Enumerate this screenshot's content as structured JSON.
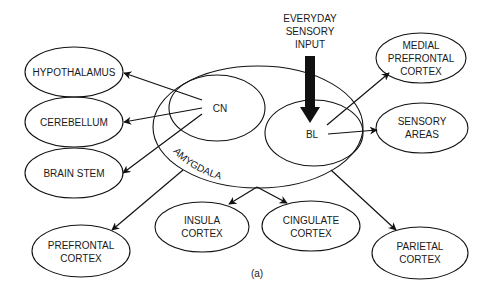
{
  "figure": {
    "caption": "(a)",
    "input_label": [
      "EVERYDAY",
      "SENSORY",
      "INPUT"
    ],
    "amygdala": {
      "label": "AMYGDALA",
      "nuclei": {
        "cn": "CN",
        "bl": "BL"
      }
    },
    "nodes": {
      "hypothalamus": [
        "HYPOTHALAMUS"
      ],
      "cerebellum": [
        "CEREBELLUM"
      ],
      "brain_stem": [
        "BRAIN STEM"
      ],
      "prefrontal_cortex": [
        "PREFRONTAL",
        "CORTEX"
      ],
      "insula_cortex": [
        "INSULA",
        "CORTEX"
      ],
      "cingulate_cortex": [
        "CINGULATE",
        "CORTEX"
      ],
      "parietal_cortex": [
        "PARIETAL",
        "CORTEX"
      ],
      "medial_prefrontal_cortex": [
        "MEDIAL",
        "PREFRONTAL",
        "CORTEX"
      ],
      "sensory_areas": [
        "SENSORY",
        "AREAS"
      ]
    },
    "edges": [
      {
        "from": "CN",
        "to": "HYPOTHALAMUS"
      },
      {
        "from": "CN",
        "to": "CEREBELLUM"
      },
      {
        "from": "CN",
        "to": "BRAIN STEM"
      },
      {
        "from": "AMYGDALA",
        "to": "PREFRONTAL CORTEX"
      },
      {
        "from": "AMYGDALA",
        "to": "INSULA CORTEX"
      },
      {
        "from": "AMYGDALA",
        "to": "CINGULATE CORTEX"
      },
      {
        "from": "AMYGDALA",
        "to": "PARIETAL CORTEX"
      },
      {
        "from": "BL",
        "to": "MEDIAL PREFRONTAL CORTEX"
      },
      {
        "from": "BL",
        "to": "SENSORY AREAS"
      },
      {
        "from": "EVERYDAY SENSORY INPUT",
        "to": "BL"
      }
    ]
  }
}
